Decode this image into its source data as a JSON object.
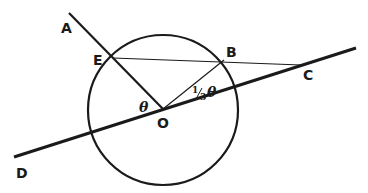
{
  "diagram": {
    "points": {
      "A": {
        "label": "A",
        "x": 69,
        "y": 13
      },
      "E": {
        "label": "E",
        "x": 113,
        "y": 58
      },
      "B": {
        "label": "B",
        "x": 224,
        "y": 60
      },
      "C": {
        "label": "C",
        "x": 301,
        "y": 65
      },
      "O": {
        "label": "O",
        "x": 163,
        "y": 109
      },
      "D": {
        "label": "D",
        "x": 14,
        "y": 157
      }
    },
    "circle": {
      "cx": 163,
      "cy": 110,
      "r": 75
    },
    "angles": {
      "theta": "θ",
      "third_theta_prefix": "1",
      "third_theta_denominator": "3",
      "third_theta_symbol": "θ"
    },
    "colors": {
      "stroke": "#1a1a1a",
      "background": "#ffffff"
    }
  }
}
